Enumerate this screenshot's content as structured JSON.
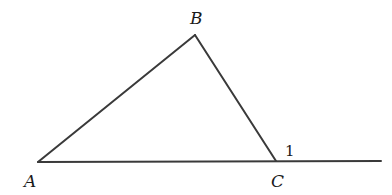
{
  "diagram": {
    "type": "geometry-triangle-exterior-angle",
    "stroke_color": "#3a3a3a",
    "text_color": "#1a1a1a",
    "points": {
      "A": {
        "x": 38,
        "y": 162,
        "label": "A",
        "label_x": 24,
        "label_y": 187
      },
      "B": {
        "x": 195,
        "y": 35,
        "label": "B",
        "label_x": 190,
        "label_y": 24
      },
      "C": {
        "x": 276,
        "y": 161,
        "label": "C",
        "label_x": 271,
        "label_y": 187
      }
    },
    "extension": {
      "from": "C",
      "to_x": 381,
      "to_y": 161
    },
    "angle_label": {
      "text": "1",
      "x": 285,
      "y": 156,
      "at": "C",
      "description": "exterior angle at C"
    },
    "segments": [
      {
        "from": "A",
        "to": "B"
      },
      {
        "from": "B",
        "to": "C"
      },
      {
        "from": "A",
        "to": "C"
      }
    ]
  }
}
